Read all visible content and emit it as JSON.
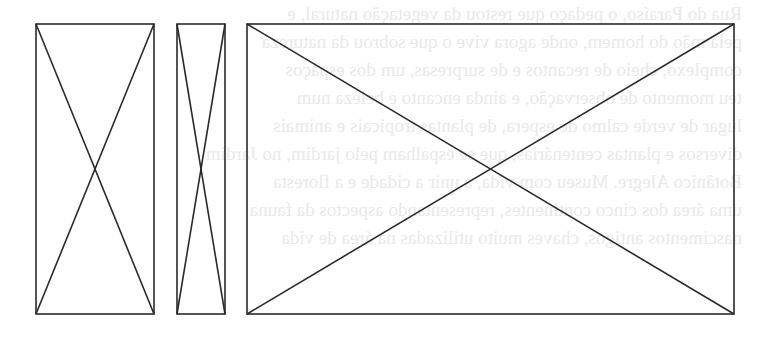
{
  "diagram": {
    "type": "placeholder-image-boxes",
    "stroke_color": "#2a2a2a",
    "background": "#ffffff",
    "boxes": [
      {
        "id": "box-1",
        "label": "narrow-portrait",
        "x": 36,
        "y": 24,
        "w": 118,
        "h": 290
      },
      {
        "id": "box-2",
        "label": "very-narrow-portrait",
        "x": 177,
        "y": 24,
        "w": 48,
        "h": 290
      },
      {
        "id": "box-3",
        "label": "wide-landscape",
        "x": 247,
        "y": 24,
        "w": 487,
        "h": 290
      }
    ]
  },
  "bleed_through_text": {
    "color": "#e9e9e9",
    "lines": [
      "Rua do Paraíso, o pedaço que restou da vegetação natural, e",
      "pela mão do homem, onde agora vive o que sobrou da natureza",
      "complexo, cheio de recantos e de surpresas, um dos espaços",
      "teu momento de observação, e ainda encanto e beleza num",
      "lugar de verde calmo de espera, de plantas tropicais e animais",
      "diversos e plantas centenárias, que se espalham pelo jardim, no Jardim",
      "Botânico Alegre. Museu com vida, a unir a cidade e a floresta",
      "uma área dos cinco continentes, representando aspectos da fauna",
      "nascimentos antigos, chaves muito utilizadas na área de vida"
    ]
  }
}
